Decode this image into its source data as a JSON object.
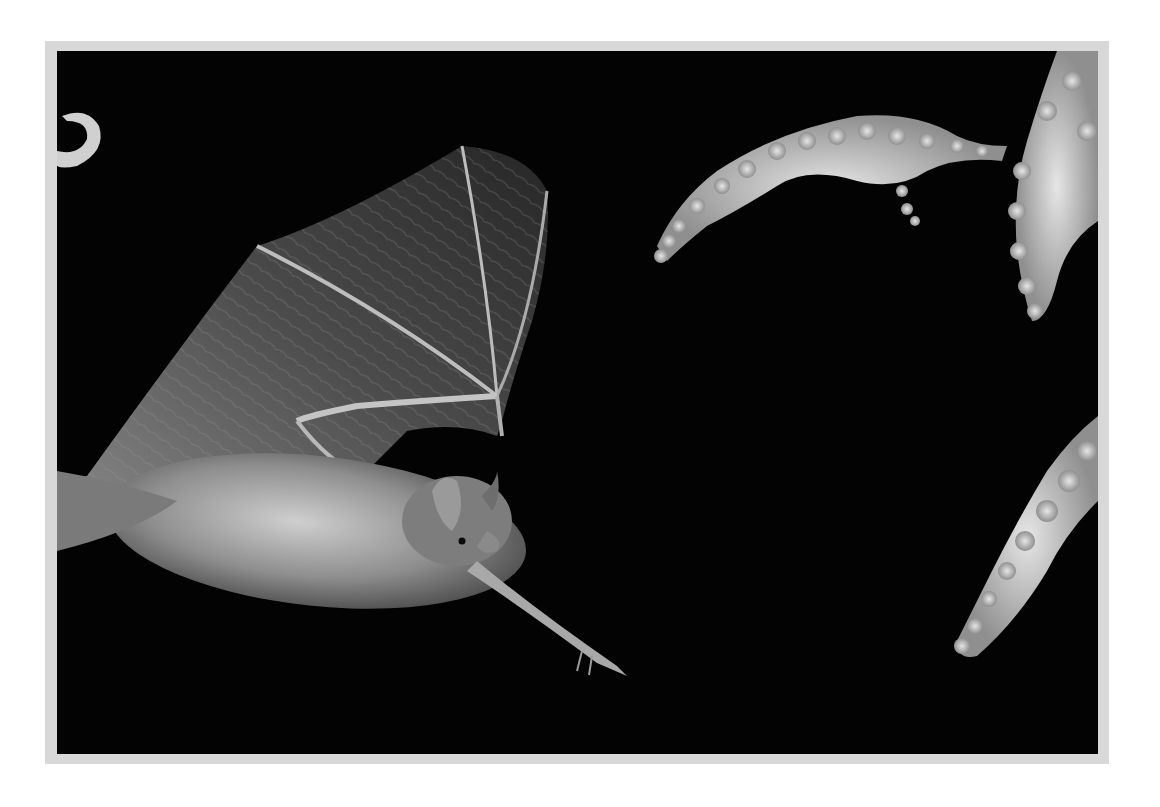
{
  "image": {
    "subject": "bat in flight at night approaching flowering plant",
    "background_color": "#030303",
    "frame_color": "#d8d8d8",
    "page_color": "#ffffff",
    "elements": [
      {
        "name": "bat",
        "description": "bat with outstretched wing, grey fur, facing right"
      },
      {
        "name": "flower-spray-top-left",
        "description": "arching white flower spike top center"
      },
      {
        "name": "flower-spray-top-right",
        "description": "hanging white flower spike top right"
      },
      {
        "name": "flower-spray-bottom-right",
        "description": "white flower spike lower right"
      },
      {
        "name": "crescent-shape",
        "description": "partial pale crescent at left edge"
      }
    ]
  }
}
